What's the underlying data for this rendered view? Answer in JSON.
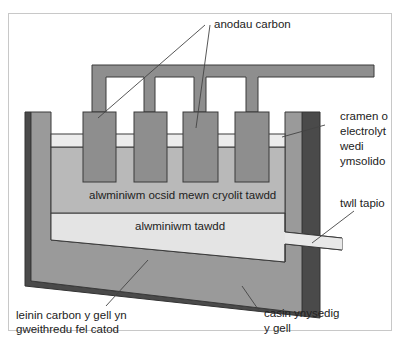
{
  "diagram": {
    "type": "electrolytic cell cross-section (Hall–Héroult aluminium smelting)",
    "colors": {
      "electrode_grey": "#8e8e8e",
      "casing_dark": "#4a4a4a",
      "crust": "#ececec",
      "electrolyte": "#b9b9b9",
      "molten_aluminium": "#e4e4e4",
      "outline": "#3a3a3a",
      "frame": "#c8c8c8"
    },
    "labels": {
      "anodes": "anodau carbon",
      "crust_line1": "cramen o",
      "crust_line2": "electrolyt",
      "crust_line3": "wedi",
      "crust_line4": "ymsolido",
      "electrolyte": "alwminiwm ocsid mewn cryolit tawdd",
      "molten_al": "alwminiwm tawdd",
      "tap_hole": "twll tapio",
      "lining_line1": "leinin carbon y gell yn",
      "lining_line2": "gweithredu fel catod",
      "casing_line1": "casin ynysedig",
      "casing_line2": "y gell"
    }
  }
}
